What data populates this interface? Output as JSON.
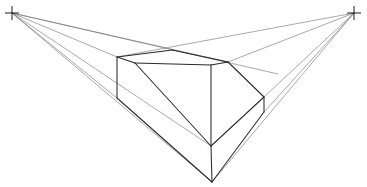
{
  "drawing": {
    "title": "Two-point perspective construction sketch",
    "description": "Freehand pencil sketch of a chamfered rectangular block drawn in two-point perspective with converging guide lines to left and right vanishing points",
    "background_color": "#ffffff",
    "guide_line_color": "#6e6e73",
    "object_line_color": "#2a2a2e",
    "vanishing_point_color": "#1a1a1c",
    "canvas": {
      "width": 367,
      "height": 187
    }
  },
  "vanishing_points": [
    {
      "name": "left-vanishing-point",
      "label": "VPL",
      "x": 12,
      "y": 13,
      "arm": 7
    },
    {
      "name": "right-vanishing-point",
      "label": "VPR",
      "x": 354,
      "y": 13,
      "arm": 7
    }
  ],
  "object_vertices": {
    "top_back_left": {
      "x": 117,
      "y": 57
    },
    "top_peak": {
      "x": 172,
      "y": 50
    },
    "top_back_right": {
      "x": 228,
      "y": 62
    },
    "top_inner_left": {
      "x": 135,
      "y": 63
    },
    "top_inner_front": {
      "x": 211,
      "y": 65
    },
    "left_face_bottom": {
      "x": 117,
      "y": 98
    },
    "bevel_right": {
      "x": 264,
      "y": 97
    },
    "bevel_right_low": {
      "x": 264,
      "y": 112
    },
    "front_mid": {
      "x": 211,
      "y": 146
    },
    "front_bottom": {
      "x": 212,
      "y": 182
    }
  },
  "guide_lines": [
    {
      "name": "guide-left-to-top-back-left",
      "x1": 12,
      "y1": 13,
      "x2": 117,
      "y2": 57
    },
    {
      "name": "guide-left-to-top-peak-extended",
      "x1": 12,
      "y1": 13,
      "x2": 228,
      "y2": 62
    },
    {
      "name": "guide-left-to-top-right-far",
      "x1": 12,
      "y1": 13,
      "x2": 278,
      "y2": 74
    },
    {
      "name": "guide-left-to-left-face-bottom",
      "x1": 12,
      "y1": 13,
      "x2": 117,
      "y2": 98
    },
    {
      "name": "guide-left-to-front-mid",
      "x1": 12,
      "y1": 13,
      "x2": 211,
      "y2": 146
    },
    {
      "name": "guide-left-to-front-bottom",
      "x1": 12,
      "y1": 13,
      "x2": 212,
      "y2": 182
    },
    {
      "name": "guide-right-to-top-back-left",
      "x1": 354,
      "y1": 13,
      "x2": 117,
      "y2": 57
    },
    {
      "name": "guide-right-to-top-back-right",
      "x1": 354,
      "y1": 13,
      "x2": 228,
      "y2": 62
    },
    {
      "name": "guide-right-to-bevel-right",
      "x1": 354,
      "y1": 13,
      "x2": 264,
      "y2": 97
    },
    {
      "name": "guide-right-to-bevel-right-low",
      "x1": 354,
      "y1": 13,
      "x2": 264,
      "y2": 112
    },
    {
      "name": "guide-right-to-front-bottom",
      "x1": 354,
      "y1": 13,
      "x2": 212,
      "y2": 182
    }
  ],
  "object_lines": [
    {
      "name": "edge-top-back-left-to-peak",
      "x1": 117,
      "y1": 57,
      "x2": 172,
      "y2": 50
    },
    {
      "name": "edge-peak-to-top-back-right",
      "x1": 172,
      "y1": 50,
      "x2": 228,
      "y2": 62
    },
    {
      "name": "edge-top-back-left-to-inner-left",
      "x1": 117,
      "y1": 57,
      "x2": 135,
      "y2": 63
    },
    {
      "name": "edge-inner-left-to-inner-front",
      "x1": 135,
      "y1": 63,
      "x2": 211,
      "y2": 65
    },
    {
      "name": "edge-inner-front-to-top-back-right",
      "x1": 211,
      "y1": 65,
      "x2": 228,
      "y2": 62
    },
    {
      "name": "edge-left-vertical",
      "x1": 117,
      "y1": 57,
      "x2": 117,
      "y2": 98
    },
    {
      "name": "edge-top-back-right-to-bevel-right",
      "x1": 228,
      "y1": 62,
      "x2": 264,
      "y2": 97
    },
    {
      "name": "edge-bevel-right-vertical",
      "x1": 264,
      "y1": 97,
      "x2": 264,
      "y2": 112
    },
    {
      "name": "edge-inner-left-to-front-mid",
      "x1": 135,
      "y1": 63,
      "x2": 211,
      "y2": 146
    },
    {
      "name": "edge-inner-front-to-front-mid",
      "x1": 211,
      "y1": 65,
      "x2": 211,
      "y2": 146
    },
    {
      "name": "edge-bevel-right-to-front-mid",
      "x1": 264,
      "y1": 97,
      "x2": 211,
      "y2": 146
    },
    {
      "name": "edge-left-face-bottom-to-front-bottom",
      "x1": 117,
      "y1": 98,
      "x2": 212,
      "y2": 182
    },
    {
      "name": "edge-front-mid-to-front-bottom",
      "x1": 211,
      "y1": 146,
      "x2": 212,
      "y2": 182
    },
    {
      "name": "edge-bevel-right-low-to-front-bottom",
      "x1": 264,
      "y1": 112,
      "x2": 212,
      "y2": 182
    }
  ]
}
